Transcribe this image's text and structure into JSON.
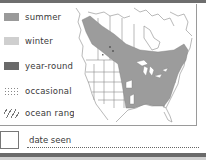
{
  "legend": {
    "items": [
      {
        "label": "summer",
        "type": "solid",
        "color": "#9a9a9a"
      },
      {
        "label": "winter",
        "type": "solid",
        "color": "#cfcfcf"
      },
      {
        "label": "year-round",
        "type": "solid",
        "color": "#6a6a6a"
      },
      {
        "label": "occasional",
        "type": "dotted",
        "color": "#888888"
      },
      {
        "label": "ocean range",
        "type": "hatched",
        "color": "#777777"
      }
    ]
  },
  "map": {
    "region": "North America",
    "range_color": "#9c9c9c",
    "outline_color": "#8a8a8a"
  },
  "footer": {
    "date_label": "date seen"
  }
}
